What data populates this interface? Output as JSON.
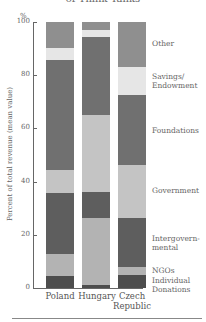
{
  "title": "of Think Tanks",
  "chart_data": {
    "type": "bar",
    "stacked": true,
    "title": "of Think Tanks",
    "xlabel": "",
    "ylabel": "Percent of total revenue (mean value)",
    "yunit": "%",
    "ylim": [
      0,
      100
    ],
    "yticks": [
      0,
      20,
      40,
      60,
      80,
      100
    ],
    "categories": [
      "Poland",
      "Hungary",
      "Czech Republic"
    ],
    "series": [
      {
        "name": "Individual Donations",
        "color": "#4d4d4d",
        "values": [
          4.5,
          1.1,
          4.9
        ]
      },
      {
        "name": "NGOs",
        "color": "#b3b3b3",
        "values": [
          8.3,
          25.2,
          3.0
        ]
      },
      {
        "name": "Intergovernmental",
        "color": "#5e5e5e",
        "values": [
          22.9,
          9.8,
          18.4
        ]
      },
      {
        "name": "Government",
        "color": "#c4c4c4",
        "values": [
          8.6,
          28.9,
          19.9
        ]
      },
      {
        "name": "Foundations",
        "color": "#707070",
        "values": [
          41.4,
          29.3,
          26.3
        ]
      },
      {
        "name": "Savings/ Endowment",
        "color": "#e6e6e6",
        "values": [
          4.5,
          2.6,
          10.5
        ]
      },
      {
        "name": "Other",
        "color": "#8f8f8f",
        "values": [
          9.8,
          3.0,
          17.0
        ]
      }
    ],
    "legend_position": "right",
    "grid": false
  },
  "axis": {
    "unit": "%",
    "ylabel": "Percent of total revenue (mean value)",
    "ticks": [
      "0",
      "20",
      "40",
      "60",
      "80",
      "100"
    ]
  },
  "xlabels": {
    "poland": "Poland",
    "hungary": "Hungary",
    "czech_1": "Czech",
    "czech_2": "Republic"
  },
  "legend": {
    "other": "Other",
    "savings_1": "Savings/",
    "savings_2": "Endowment",
    "foundations": "Foundations",
    "government": "Government",
    "intergov_1": "Intergovern-",
    "intergov_2": "mental",
    "ngos": "NGOs",
    "individual_1": "Individual",
    "individual_2": "Donations"
  }
}
